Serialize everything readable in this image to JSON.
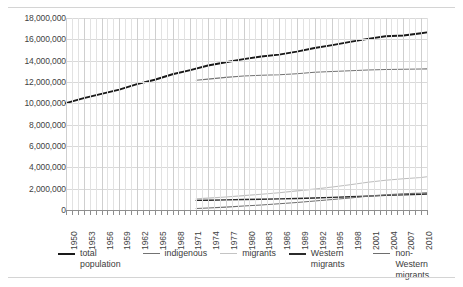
{
  "chart_data": {
    "type": "line",
    "title": "",
    "subtitle": "",
    "xlabel": "",
    "ylabel": "",
    "xlim": [
      1950,
      2011
    ],
    "ylim": [
      0,
      18000000
    ],
    "ytick_labels": [
      "18,000,000",
      "16,000,000",
      "14,000,000",
      "12,000,000",
      "10,000,000",
      "8,000,000",
      "6,000,000",
      "4,000,000",
      "2,000,000",
      "0"
    ],
    "ytick_values": [
      18000000,
      16000000,
      14000000,
      12000000,
      10000000,
      8000000,
      6000000,
      4000000,
      2000000,
      0
    ],
    "xtick_labels": [
      "1950",
      "1953",
      "1956",
      "1959",
      "1962",
      "1965",
      "1968",
      "1971",
      "1974",
      "1977",
      "1980",
      "1983",
      "1986",
      "1989",
      "1992",
      "1995",
      "1998",
      "2001",
      "2004",
      "2007",
      "2010"
    ],
    "xtick_values": [
      1950,
      1953,
      1956,
      1959,
      1962,
      1965,
      1968,
      1971,
      1974,
      1977,
      1980,
      1983,
      1986,
      1989,
      1992,
      1995,
      1998,
      2001,
      2004,
      2007,
      2010
    ],
    "grid": true,
    "grid_minor_vertical": true,
    "legend_position": "bottom",
    "series": [
      {
        "name": "total population",
        "color": "#1a1a1a",
        "width": 1.9,
        "x": [
          1950,
          1953,
          1956,
          1959,
          1962,
          1965,
          1968,
          1971,
          1974,
          1977,
          1980,
          1983,
          1986,
          1989,
          1992,
          1995,
          1998,
          2001,
          2004,
          2007,
          2010,
          2011
        ],
        "values": [
          10026773,
          10493184,
          10888000,
          11278000,
          11805689,
          12212269,
          12725000,
          13119430,
          13545000,
          13856000,
          14150000,
          14394000,
          14572000,
          14849000,
          15184000,
          15459000,
          15760000,
          16046000,
          16292000,
          16358000,
          16575000,
          16656000
        ]
      },
      {
        "name": "indigenous",
        "color": "#737373",
        "width": 1.1,
        "x": [
          1972,
          1974,
          1977,
          1980,
          1983,
          1986,
          1989,
          1992,
          1995,
          1998,
          2001,
          2004,
          2007,
          2010,
          2011
        ],
        "values": [
          12160000,
          12270000,
          12430000,
          12560000,
          12630000,
          12680000,
          12780000,
          12910000,
          12990000,
          13060000,
          13120000,
          13170000,
          13190000,
          13215000,
          13230000
        ]
      },
      {
        "name": "migrants",
        "color": "#bdbdbd",
        "width": 1.1,
        "x": [
          1972,
          1974,
          1977,
          1980,
          1983,
          1986,
          1989,
          1992,
          1995,
          1998,
          2001,
          2004,
          2007,
          2010,
          2011
        ],
        "values": [
          1040000,
          1110000,
          1220000,
          1350000,
          1480000,
          1620000,
          1790000,
          1960000,
          2160000,
          2370000,
          2600000,
          2790000,
          2930000,
          3050000,
          3120000
        ]
      },
      {
        "name": "Western migrants",
        "color": "#2b2b2b",
        "width": 1.4,
        "x": [
          1972,
          1974,
          1977,
          1980,
          1983,
          1986,
          1989,
          1992,
          1995,
          1998,
          2001,
          2004,
          2007,
          2010,
          2011
        ],
        "values": [
          900000,
          920000,
          950000,
          980000,
          1010000,
          1040000,
          1080000,
          1120000,
          1180000,
          1240000,
          1300000,
          1370000,
          1420000,
          1470000,
          1500000
        ]
      },
      {
        "name": "non-Western migrants",
        "color": "#6e6e6e",
        "width": 1.1,
        "x": [
          1972,
          1974,
          1977,
          1980,
          1983,
          1986,
          1989,
          1992,
          1995,
          1998,
          2001,
          2004,
          2007,
          2010,
          2011
        ],
        "values": [
          140000,
          190000,
          270000,
          370000,
          470000,
          580000,
          710000,
          840000,
          980000,
          1130000,
          1300000,
          1420000,
          1510000,
          1580000,
          1620000
        ]
      }
    ]
  },
  "legend": {
    "items": [
      {
        "label": "total population",
        "color": "#1a1a1a",
        "width": 2.2
      },
      {
        "label": "indigenous",
        "color": "#737373",
        "width": 1.4
      },
      {
        "label": "migrants",
        "color": "#c4c4c4",
        "width": 1.4
      },
      {
        "label": "Western migrants",
        "color": "#2b2b2b",
        "width": 2.0
      },
      {
        "label": "non-Western migrants",
        "color": "#6e6e6e",
        "width": 1.4
      }
    ]
  }
}
